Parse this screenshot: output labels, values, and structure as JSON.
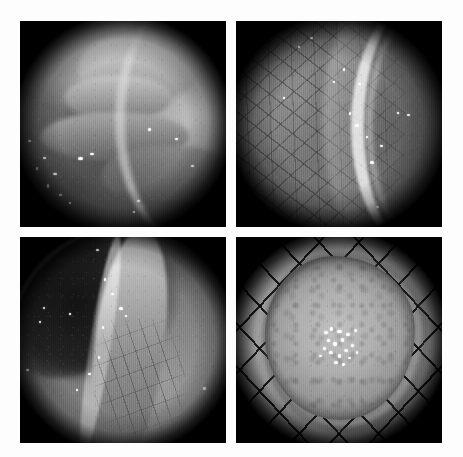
{
  "page": {
    "background_color": "#fdfdfd",
    "width": 463,
    "height": 457
  },
  "caption_strip": {
    "visible": true,
    "note": "row of small caption text clipped at the very top edge of the page; only the lower pixel fringe is rendered, text is illegible",
    "fragments": [
      "",
      "",
      "",
      ""
    ],
    "color": "#f2f2f3"
  },
  "figure": {
    "type": "image-panel-grid",
    "rows": 2,
    "columns": 2,
    "panel_count": 4,
    "modality": "grayscale endoscopy",
    "panels": [
      {
        "id": "panel-1",
        "position": "top-left",
        "label": "",
        "description": "Endoscopic view of mucosal folds with a broad pale ridge running across the upper field; bright specular highlights scattered over the lower-left mucosa; dark vignetted corners from the circular endoscope aperture.",
        "dominant_tone": "mid-gray",
        "features": [
          "mucosal-folds",
          "specular-highlights",
          "bright-arc-upper-right",
          "dark-corner-vignette"
        ]
      },
      {
        "id": "panel-2",
        "position": "top-right",
        "label": "",
        "description": "Close-up of mucosa showing a dense reticular vascular network across the left two-thirds; a smooth pale ridge and a bright crescent reflection along the right border; darker field toward the lower right.",
        "dominant_tone": "mid-gray",
        "features": [
          "reticular-vascular-pattern",
          "pale-ridge",
          "bright-crescent-right",
          "dark-corner-vignette"
        ]
      },
      {
        "id": "panel-3",
        "position": "bottom-left",
        "label": "",
        "description": "Endoscopic view down the lumen: a dark lumen opening occupies the upper left while a long pale ulcerated / resected strip with a bright raised edge runs diagonally down the centre-right of the field.",
        "dominant_tone": "dark-gray",
        "features": [
          "dark-lumen",
          "longitudinal-lesion",
          "bright-lesion-margin",
          "fissured-surface",
          "dark-corner-vignette"
        ]
      },
      {
        "id": "panel-4",
        "position": "bottom-right",
        "label": "",
        "description": "Ex-vivo resected specimen pinned flat and stretched over a diamond mesh board; the roughly circular pale specimen fills the centre with darker mottled margins and a cluster of bright white mucus/reflection flecks near the middle.",
        "dominant_tone": "light-gray",
        "features": [
          "resected-specimen",
          "diamond-mesh-board",
          "central-white-flecks",
          "mottled-margins",
          "dark-corner-vignette"
        ]
      }
    ]
  }
}
